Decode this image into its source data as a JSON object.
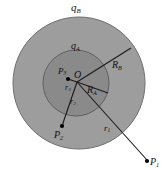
{
  "figure": {
    "background": "#ffffff",
    "width": 162,
    "height": 170,
    "colors": {
      "outer_shell_fill": "#9d9d9d",
      "inner_sphere_fill": "#8a8a8a",
      "outer_shell_stroke": "#6e6e6e",
      "inner_sphere_stroke": "#5f5f5f",
      "line": "#1a1a1a",
      "point": "#000000"
    }
  },
  "geometry": {
    "center": {
      "label": "O",
      "x": 76,
      "y": 83
    },
    "outer_circle": {
      "cx": 79,
      "cy": 83,
      "r": 66
    },
    "inner_circle": {
      "cx": 76,
      "cy": 83,
      "r": 33
    }
  },
  "labels": {
    "charge_outer": "q",
    "charge_outer_sub": "B",
    "charge_inner": "q",
    "charge_inner_sub": "A",
    "origin": "O",
    "radius_inner": "R",
    "radius_inner_sub": "A",
    "radius_outer": "R",
    "radius_outer_sub": "B",
    "point_one": "P",
    "point_one_sub": "1",
    "point_two": "P",
    "point_two_sub": "2",
    "point_three": "P",
    "point_three_sub": "3",
    "dist_one": "r",
    "dist_one_sub": "1",
    "dist_two": "r",
    "dist_two_sub": "2",
    "dist_three": "r",
    "dist_three_sub": "3"
  },
  "points": [
    {
      "name": "P1",
      "x": 148,
      "y": 161,
      "inside": "outside-shell"
    },
    {
      "name": "P2",
      "x": 62,
      "y": 127,
      "inside": "inside-inner-sphere"
    },
    {
      "name": "P3",
      "x": 68,
      "y": 79,
      "inside": "inside-inner-sphere"
    }
  ],
  "segments": [
    {
      "name": "center-to-P1",
      "from": "O",
      "to": "P1",
      "label": "r1"
    },
    {
      "name": "center-to-P2",
      "from": "O",
      "to": "P2",
      "label": "r2"
    },
    {
      "name": "center-to-P3",
      "from": "O",
      "to": "P3",
      "label": "r3"
    },
    {
      "name": "center-to-inner-rim",
      "from": "O",
      "to": "inner-circle-edge",
      "label": "RA"
    },
    {
      "name": "center-to-outer-rim",
      "from": "O",
      "to": "outer-circle-edge",
      "label": "RB"
    }
  ]
}
